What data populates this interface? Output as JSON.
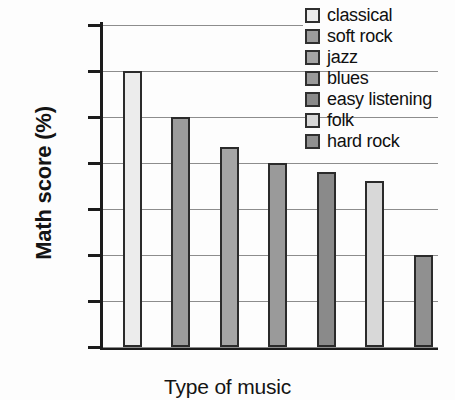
{
  "chart_data": {
    "type": "bar",
    "title": "",
    "xlabel": "Type of music",
    "ylabel": "Math score (%)",
    "categories": [
      "classical",
      "soft rock",
      "jazz",
      "blues",
      "easy listening",
      "folk",
      "hard rock"
    ],
    "values": [
      80,
      75,
      71.7,
      70,
      69,
      68,
      60
    ],
    "ylim": [
      50,
      85
    ],
    "ytick_labels": [
      "85",
      "80",
      "75",
      "70",
      "65",
      "60",
      "55",
      "50"
    ],
    "ytick_values": [
      85,
      80,
      75,
      70,
      65,
      60,
      55,
      50
    ],
    "grid": true,
    "legend_position": "top-right",
    "bar_colors": [
      "#ececec",
      "#9c9c9c",
      "#a5a5a5",
      "#9a9a9a",
      "#8a8a8a",
      "#d8d8d8",
      "#909090"
    ],
    "axis_color": "#1b1b1b",
    "grid_color": "#8d8d8d",
    "bar_border_color": "#2b2b2b"
  },
  "legend": {
    "items": [
      {
        "label": "classical",
        "color": "#ececec"
      },
      {
        "label": "soft rock",
        "color": "#9c9c9c"
      },
      {
        "label": "jazz",
        "color": "#a5a5a5"
      },
      {
        "label": "blues",
        "color": "#9a9a9a"
      },
      {
        "label": "easy listening",
        "color": "#8a8a8a"
      },
      {
        "label": "folk",
        "color": "#d8d8d8"
      },
      {
        "label": "hard rock",
        "color": "#909090"
      }
    ]
  }
}
